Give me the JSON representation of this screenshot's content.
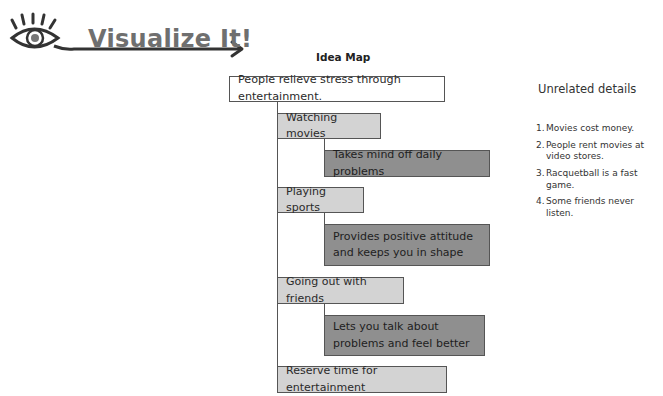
{
  "header": {
    "logo_text": "Visualize It!",
    "logo_icon": "eye-arrow-icon"
  },
  "diagram": {
    "title": "Idea Map",
    "root": "People relieve stress through entertainment.",
    "branches": [
      {
        "label": "Watching movies",
        "detail": "Takes mind off daily problems"
      },
      {
        "label": "Playing sports",
        "detail": "Provides positive attitude and keeps you in shape"
      },
      {
        "label": "Going out with friends",
        "detail": "Lets you talk about problems and feel better"
      }
    ],
    "conclusion": "Reserve time for entertainment"
  },
  "sidebar": {
    "title": "Unrelated details",
    "items": [
      {
        "num": "1.",
        "text": "Movies cost money."
      },
      {
        "num": "2.",
        "text": "People rent movies at video stores."
      },
      {
        "num": "3.",
        "text": "Racquetball is a fast game."
      },
      {
        "num": "4.",
        "text": "Some friends never listen."
      }
    ]
  },
  "colors": {
    "level1_fill": "#d3d3d3",
    "level2_fill": "#8f8f8f",
    "logo_text": "#6f6f6f",
    "border": "#555555"
  }
}
